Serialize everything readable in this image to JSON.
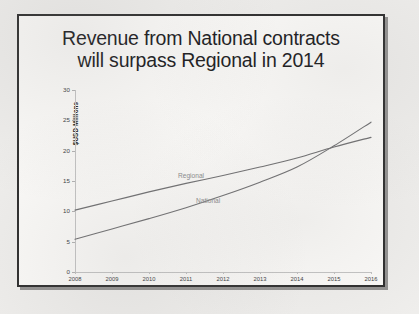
{
  "slide": {
    "title_line_1": "Revenue from National contracts",
    "title_line_2": "will surpass Regional in 2014"
  },
  "chart_data": {
    "type": "line",
    "title": "Revenue from National contracts will surpass Regional in 2014",
    "xlabel": "",
    "ylabel": "$USD Millions",
    "x": [
      2008,
      2009,
      2010,
      2011,
      2012,
      2013,
      2014,
      2015,
      2016
    ],
    "categories": [
      "2008",
      "2009",
      "2010",
      "2011",
      "2012",
      "2013",
      "2014",
      "2015",
      "2016"
    ],
    "series": [
      {
        "name": "Regional",
        "values": [
          10.2,
          11.7,
          13.2,
          14.6,
          15.9,
          17.3,
          18.8,
          20.6,
          22.2
        ]
      },
      {
        "name": "National",
        "values": [
          5.4,
          7.1,
          8.8,
          10.6,
          12.6,
          14.8,
          17.3,
          20.8,
          24.7
        ]
      }
    ],
    "ylim": [
      0,
      30
    ],
    "yticks": [
      0,
      5,
      10,
      15,
      20,
      25,
      30
    ],
    "ytick_labels": [
      "0",
      "5",
      "10",
      "15",
      "20",
      "25",
      "30"
    ],
    "xlim": [
      2008,
      2016
    ],
    "grid": false,
    "legend": "inline-labels",
    "annotations": [
      {
        "text": "Regional",
        "series": "Regional"
      },
      {
        "text": "National",
        "series": "National"
      }
    ],
    "series_color": "#6e6e70",
    "axis_color": "#c3c3c3",
    "label_color": "#8a8a8c"
  }
}
